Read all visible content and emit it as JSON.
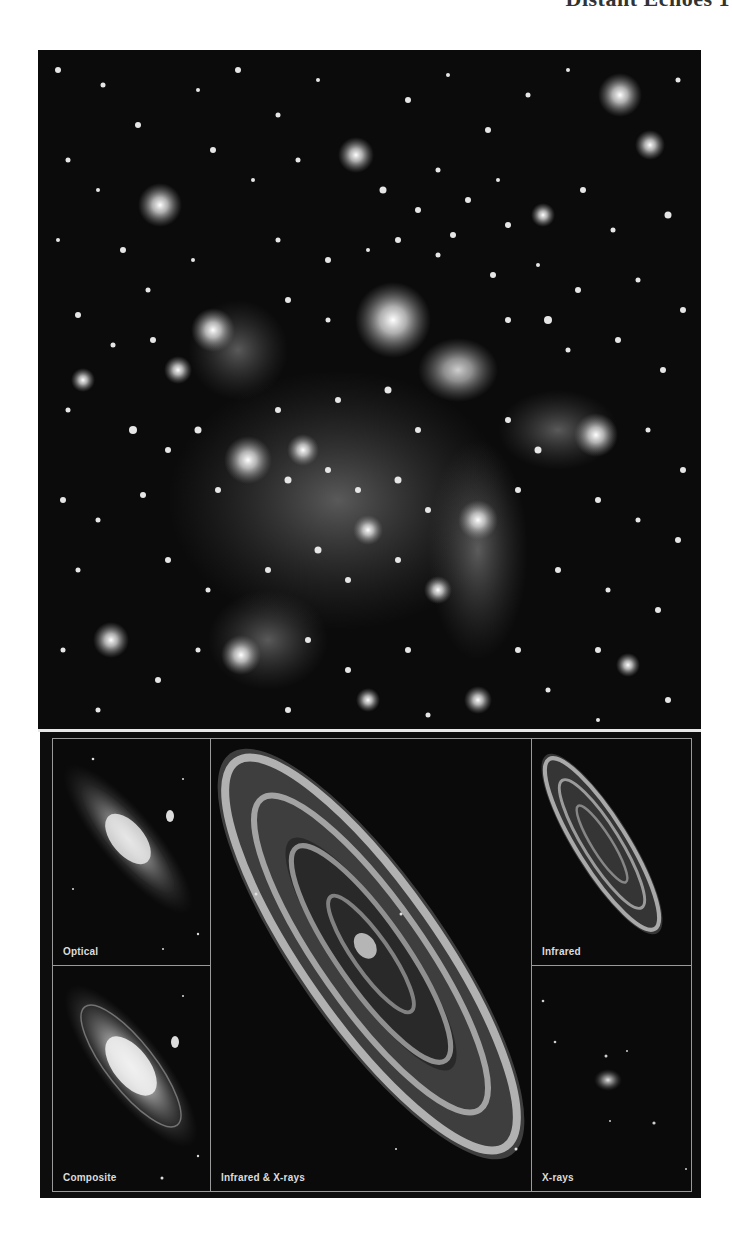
{
  "page": {
    "running_head": "Distant Echoes   1"
  },
  "figure": {
    "main_image": {
      "description": "Wide-field star cluster image, grayscale"
    },
    "panels": [
      {
        "id": "optical",
        "label": "Optical"
      },
      {
        "id": "composite",
        "label": "Composite"
      },
      {
        "id": "infrared-xrays",
        "label": "Infrared & X-rays"
      },
      {
        "id": "infrared",
        "label": "Infrared"
      },
      {
        "id": "xrays",
        "label": "X-rays"
      }
    ]
  },
  "colors": {
    "background": "#ffffff",
    "image_black": "#0b0b0b",
    "frame_line": "#9a9a9a",
    "label_text": "#dcdcdc"
  }
}
